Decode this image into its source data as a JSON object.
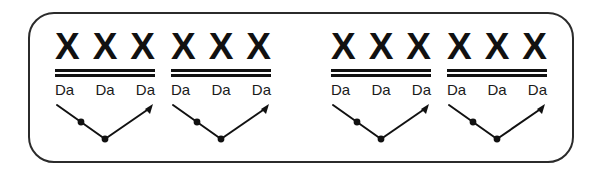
{
  "figure": {
    "type": "rhythm-notation-diagram",
    "frame": {
      "shape": "rounded-rectangle",
      "stroke_color": "#2b2b2b",
      "fill_color": "#ffffff"
    },
    "ink_color": "#111111",
    "background_color": "#ffffff",
    "group_count": 4,
    "groups": [
      {
        "id": "group-1",
        "notes": [
          "X",
          "X",
          "X"
        ],
        "beam_lines": 2,
        "syllables": [
          "Da",
          "Da",
          "Da"
        ],
        "arrow": {
          "shape": "v-path",
          "dots": 2,
          "arrowheads": [
            "right-end"
          ]
        }
      },
      {
        "id": "group-2",
        "notes": [
          "X",
          "X",
          "X"
        ],
        "beam_lines": 2,
        "syllables": [
          "Da",
          "Da",
          "Da"
        ],
        "arrow": {
          "shape": "v-path",
          "dots": 2,
          "arrowheads": [
            "right-end"
          ]
        }
      },
      {
        "id": "group-3",
        "notes": [
          "X",
          "X",
          "X"
        ],
        "beam_lines": 2,
        "syllables": [
          "Da",
          "Da",
          "Da"
        ],
        "arrow": {
          "shape": "v-path",
          "dots": 2,
          "arrowheads": [
            "right-end"
          ]
        }
      },
      {
        "id": "group-4",
        "notes": [
          "X",
          "X",
          "X"
        ],
        "beam_lines": 2,
        "syllables": [
          "Da",
          "Da",
          "Da"
        ],
        "arrow": {
          "shape": "v-path",
          "dots": 2,
          "arrowheads": [
            "right-end"
          ]
        }
      }
    ]
  }
}
